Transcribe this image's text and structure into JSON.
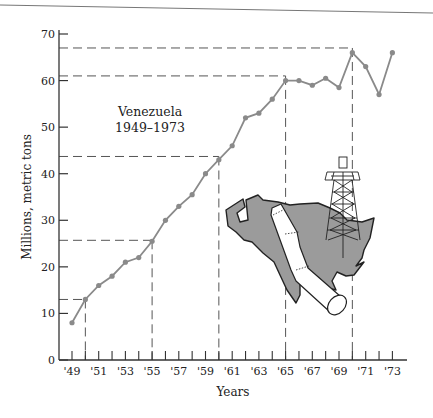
{
  "chart_data": {
    "type": "line",
    "title": "",
    "annotation": {
      "line1": "Venezuela",
      "line2": "1949–1973"
    },
    "xlabel": "Years",
    "ylabel": "Millions, metric tons",
    "x": [
      1949,
      1950,
      1951,
      1952,
      1953,
      1954,
      1955,
      1956,
      1957,
      1958,
      1959,
      1960,
      1961,
      1962,
      1963,
      1964,
      1965,
      1966,
      1967,
      1968,
      1969,
      1970,
      1971,
      1972,
      1973
    ],
    "values": [
      8,
      13,
      16,
      18,
      21,
      22,
      25.5,
      30,
      33,
      35.5,
      40,
      43,
      46,
      52,
      53,
      56,
      60,
      60,
      59,
      60.5,
      58.5,
      66,
      63,
      57,
      66
    ],
    "series": [
      {
        "name": "Oil production, Venezuela",
        "values": [
          8,
          13,
          16,
          18,
          21,
          22,
          25.5,
          30,
          33,
          35.5,
          40,
          43,
          46,
          52,
          53,
          56,
          60,
          60,
          59,
          60.5,
          58.5,
          66,
          63,
          57,
          66
        ]
      }
    ],
    "ylim": [
      0,
      70
    ],
    "xlim": [
      1948,
      1973.8
    ],
    "y_ticks": [
      0,
      10,
      20,
      30,
      40,
      50,
      60,
      70
    ],
    "x_tick_labels": [
      "'49",
      "'51",
      "'53",
      "'55",
      "'57",
      "'59",
      "'61",
      "'63",
      "'65",
      "'67",
      "'69",
      "'71",
      "'73"
    ],
    "x_tick_label_years": [
      1949,
      1951,
      1953,
      1955,
      1957,
      1959,
      1961,
      1963,
      1965,
      1967,
      1969,
      1971,
      1973
    ],
    "reference_lines": [
      {
        "year": 1950,
        "value": 13
      },
      {
        "year": 1955,
        "value": 25.7
      },
      {
        "year": 1960,
        "value": 43.7
      },
      {
        "year": 1965,
        "value": 61
      },
      {
        "year": 1970,
        "value": 67
      }
    ],
    "grid": false,
    "legend": "none",
    "colors": {
      "line": "#8a8a8a",
      "marker": "#8a8a8a",
      "axis": "#333333",
      "dash": "#555555",
      "map_fill": "#9b9b9b",
      "map_stroke": "#222222"
    },
    "illustration": "map-of-venezuela-with-oil-derrick-and-pipeline"
  }
}
